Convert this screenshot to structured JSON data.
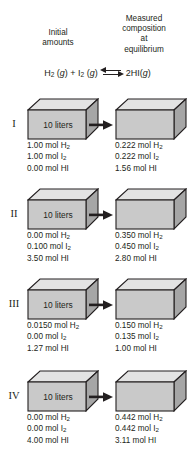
{
  "headers": {
    "initial": "Initial\namounts",
    "measured": "Measured\ncomposition\nat\nequilibrium"
  },
  "equation": {
    "left": "H2 (g) + I2 (g)",
    "arrow_icon": "equilibrium-double-arrow",
    "right": "2HI(g)"
  },
  "box_label": "10 liters",
  "arrow_icon": "right-arrow-icon",
  "colors": {
    "box_front": "#c9c9c9",
    "box_top": "#e3e3e3",
    "box_side": "#a6a6a6",
    "outline": "#231f20",
    "text": "#231f20",
    "background": "#ffffff"
  },
  "rows": [
    {
      "label": "I",
      "box_label": "10 liters",
      "initial": [
        {
          "amount": "1.00",
          "unit": "mol",
          "species": "H",
          "sub": "2"
        },
        {
          "amount": "1.00",
          "unit": "mol",
          "species": "I",
          "sub": "2"
        },
        {
          "amount": "0.00",
          "unit": "mol",
          "species": "HI",
          "sub": ""
        }
      ],
      "equilibrium": [
        {
          "amount": "0.222",
          "unit": "mol",
          "species": "H",
          "sub": "2"
        },
        {
          "amount": "0.222",
          "unit": "mol",
          "species": "I",
          "sub": "2"
        },
        {
          "amount": "1.56",
          "unit": "mol",
          "species": "HI",
          "sub": ""
        }
      ]
    },
    {
      "label": "II",
      "box_label": "10 liters",
      "initial": [
        {
          "amount": "0.00",
          "unit": "mol",
          "species": "H",
          "sub": "2"
        },
        {
          "amount": "0.100",
          "unit": "mol",
          "species": "I",
          "sub": "2"
        },
        {
          "amount": "3.50",
          "unit": "mol",
          "species": "HI",
          "sub": ""
        }
      ],
      "equilibrium": [
        {
          "amount": "0.350",
          "unit": "mol",
          "species": "H",
          "sub": "2"
        },
        {
          "amount": "0.450",
          "unit": "mol",
          "species": "I",
          "sub": "2"
        },
        {
          "amount": "2.80",
          "unit": "mol",
          "species": "HI",
          "sub": ""
        }
      ]
    },
    {
      "label": "III",
      "box_label": "10 liters",
      "initial": [
        {
          "amount": "0.0150",
          "unit": "mol",
          "species": "H",
          "sub": "2"
        },
        {
          "amount": "0.00",
          "unit": "mol",
          "species": "I",
          "sub": "2"
        },
        {
          "amount": "1.27",
          "unit": "mol",
          "species": "HI",
          "sub": ""
        }
      ],
      "equilibrium": [
        {
          "amount": "0.150",
          "unit": "mol",
          "species": "H",
          "sub": "2"
        },
        {
          "amount": "0.135",
          "unit": "mol",
          "species": "I",
          "sub": "2"
        },
        {
          "amount": "1.00",
          "unit": "mol",
          "species": "HI",
          "sub": ""
        }
      ]
    },
    {
      "label": "IV",
      "box_label": "10 liters",
      "initial": [
        {
          "amount": "0.00",
          "unit": "mol",
          "species": "H",
          "sub": "2"
        },
        {
          "amount": "0.00",
          "unit": "mol",
          "species": "I",
          "sub": "2"
        },
        {
          "amount": "4.00",
          "unit": "mol",
          "species": "HI",
          "sub": ""
        }
      ],
      "equilibrium": [
        {
          "amount": "0.442",
          "unit": "mol",
          "species": "H",
          "sub": "2"
        },
        {
          "amount": "0.442",
          "unit": "mol",
          "species": "I",
          "sub": "2"
        },
        {
          "amount": "3.11",
          "unit": "mol",
          "species": "HI",
          "sub": ""
        }
      ]
    }
  ]
}
